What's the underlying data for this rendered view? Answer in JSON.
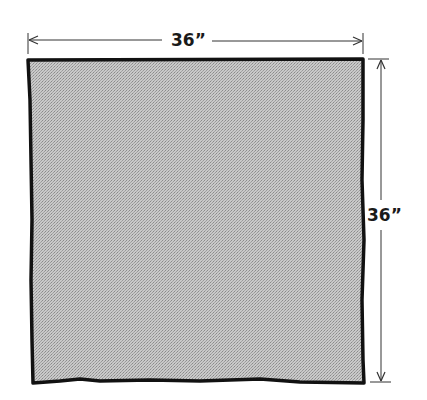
{
  "diagram": {
    "shape": "square fabric piece",
    "fill_color": "#bdbdbd",
    "outline_color": "#111111",
    "width_label": "36”",
    "height_label": "36”"
  }
}
